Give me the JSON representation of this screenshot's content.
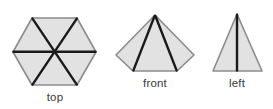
{
  "figure": {
    "background_color": "#ffffff",
    "fill_color": "#e2e2e2",
    "outline_color": "#8c8c8c",
    "edge_color": "#1a1a1a",
    "label_color": "#3a3a3a"
  },
  "views": [
    {
      "id": "top",
      "label": "top",
      "shape": "hexagon",
      "description": "regular hexagon divided into six triangles by three diameters meeting at the center",
      "outline_points": "55,18 32,18 13,52 32,85 77,85 96,52 77,18",
      "polygon": "55,18 32,18 13,52 32,85 77,85 96,52",
      "center": "54.5,51.5",
      "internal_lines": [
        {
          "name": "diameter-horizontal",
          "x1": 13,
          "y1": 52,
          "x2": 96,
          "y2": 52
        },
        {
          "name": "diameter-upper-left-to-lower-right",
          "x1": 32,
          "y1": 18,
          "x2": 77,
          "y2": 85
        },
        {
          "name": "diameter-upper-right-to-lower-left",
          "x1": 77,
          "y1": 18,
          "x2": 32,
          "y2": 85
        }
      ]
    },
    {
      "id": "front",
      "label": "front",
      "shape": "pentagon",
      "description": "pentagon with apex at top and two edges descending from the apex to the bottom corners",
      "polygon": "155,15 194,55 177,71 133,71 116,55",
      "apex": "155,15",
      "internal_lines": [
        {
          "name": "edge-apex-to-bottom-left",
          "x1": 155,
          "y1": 15,
          "x2": 133,
          "y2": 71
        },
        {
          "name": "edge-apex-to-bottom-right",
          "x1": 155,
          "y1": 15,
          "x2": 177,
          "y2": 71
        }
      ]
    },
    {
      "id": "left",
      "label": "left",
      "shape": "triangle",
      "description": "isosceles triangle with a vertical edge from the apex to the base midpoint",
      "polygon": "237,14 262,71 213,71",
      "apex": "237,14",
      "internal_lines": [
        {
          "name": "edge-apex-to-base-midpoint",
          "x1": 237,
          "y1": 14,
          "x2": 237,
          "y2": 71
        }
      ]
    }
  ]
}
